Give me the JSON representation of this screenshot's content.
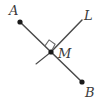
{
  "figure": {
    "type": "geometry-diagram",
    "width": 103,
    "height": 105,
    "background_color": "#ffffff",
    "stroke_color": "#4a4a4a",
    "dot_color": "#1a1a1a",
    "labels": {
      "a": "A",
      "l": "L",
      "m": "M",
      "b": "B"
    },
    "points": {
      "A": {
        "x": 20,
        "y": 22
      },
      "M": {
        "x": 51,
        "y": 52
      },
      "B": {
        "x": 82,
        "y": 82
      },
      "L_end": {
        "x": 82,
        "y": 20
      },
      "L_opposite_end": {
        "x": 36,
        "y": 64
      }
    },
    "segments": [
      {
        "name": "segment-AB",
        "from": "A",
        "to": "B"
      },
      {
        "name": "ray-ML",
        "from": "M",
        "to": "L_end"
      },
      {
        "name": "segment-M-opposite",
        "from": "M",
        "to": "L_opposite_end"
      }
    ],
    "markers": {
      "right_angle": {
        "name": "right-angle-marker",
        "vertex_x": 51,
        "vertex_y": 52,
        "size": 9
      }
    },
    "dots": [
      {
        "name": "point-dot-A",
        "x": 20,
        "y": 22,
        "r": 2.6
      },
      {
        "name": "point-dot-M",
        "x": 51,
        "y": 52,
        "r": 2.6
      },
      {
        "name": "point-dot-B",
        "x": 82,
        "y": 82,
        "r": 2.6
      }
    ]
  }
}
